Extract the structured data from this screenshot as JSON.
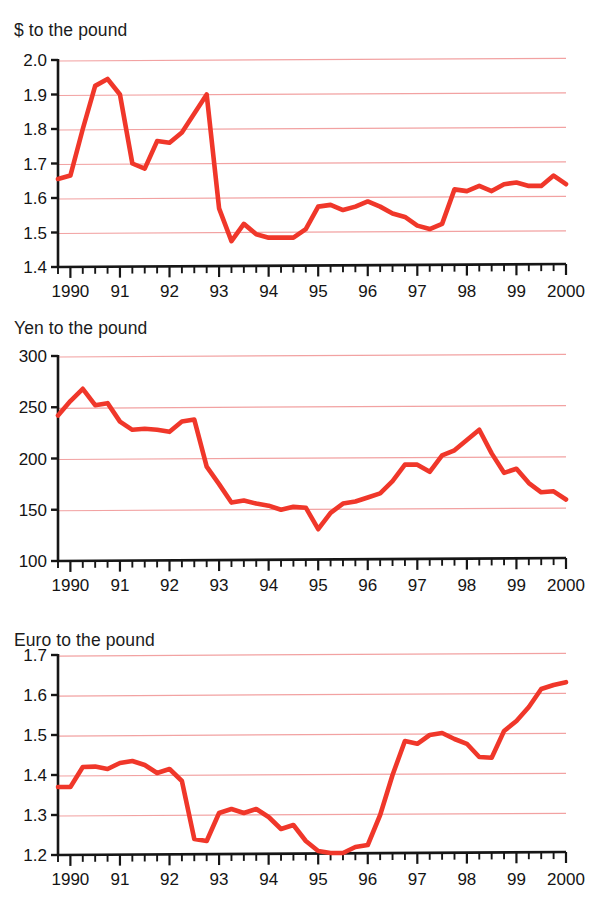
{
  "page": {
    "background": "#ffffff",
    "accent_red": "#f0372a",
    "grid_color": "#f2a2a2",
    "axis_color": "#161616"
  },
  "charts": [
    {
      "id": "dollar-to-pound",
      "title": "$ to the pound",
      "chart_data": {
        "type": "line",
        "title": "$ to the pound",
        "xlabel": "",
        "ylabel": "",
        "ylim": [
          1.4,
          2.0
        ],
        "yticks": [
          1.4,
          1.5,
          1.6,
          1.7,
          1.8,
          1.9,
          2.0
        ],
        "ytick_labels": [
          "1.4",
          "1.5",
          "1.6",
          "1.7",
          "1.8",
          "1.9",
          "2.0"
        ],
        "xlim": [
          1989.75,
          2000.0
        ],
        "xticks": [
          1990,
          1991,
          1992,
          1993,
          1994,
          1995,
          1996,
          1997,
          1998,
          1999,
          2000
        ],
        "xtick_labels": [
          "1990",
          "91",
          "92",
          "93",
          "94",
          "95",
          "96",
          "97",
          "98",
          "99",
          "2000"
        ],
        "grid": true,
        "legend": "none",
        "x": [
          1989.75,
          1990.0,
          1990.25,
          1990.5,
          1990.75,
          1991.0,
          1991.25,
          1991.5,
          1991.75,
          1992.0,
          1992.25,
          1992.5,
          1992.75,
          1993.0,
          1993.25,
          1993.5,
          1993.75,
          1994.0,
          1994.25,
          1994.5,
          1994.75,
          1995.0,
          1995.25,
          1995.5,
          1995.75,
          1996.0,
          1996.25,
          1996.5,
          1996.75,
          1997.0,
          1997.25,
          1997.5,
          1997.75,
          1998.0,
          1998.25,
          1998.5,
          1998.75,
          1999.0,
          1999.25,
          1999.5,
          1999.75,
          2000.0
        ],
        "values": [
          1.655,
          1.665,
          1.8,
          1.925,
          1.945,
          1.9,
          1.7,
          1.685,
          1.765,
          1.76,
          1.79,
          1.845,
          1.9,
          1.57,
          1.475,
          1.525,
          1.495,
          1.485,
          1.485,
          1.485,
          1.51,
          1.575,
          1.58,
          1.565,
          1.575,
          1.59,
          1.575,
          1.555,
          1.545,
          1.52,
          1.51,
          1.525,
          1.625,
          1.62,
          1.635,
          1.62,
          1.64,
          1.645,
          1.635,
          1.635,
          1.665,
          1.64
        ]
      }
    },
    {
      "id": "yen-to-pound",
      "title": "Yen to the pound",
      "chart_data": {
        "type": "line",
        "title": "Yen to the pound",
        "xlabel": "",
        "ylabel": "",
        "ylim": [
          100,
          300
        ],
        "yticks": [
          100,
          150,
          200,
          250,
          300
        ],
        "ytick_labels": [
          "100",
          "150",
          "200",
          "250",
          "300"
        ],
        "xlim": [
          1989.75,
          2000.0
        ],
        "xticks": [
          1990,
          1991,
          1992,
          1993,
          1994,
          1995,
          1996,
          1997,
          1998,
          1999,
          2000
        ],
        "xtick_labels": [
          "1990",
          "91",
          "92",
          "93",
          "94",
          "95",
          "96",
          "97",
          "98",
          "99",
          "2000"
        ],
        "grid": true,
        "legend": "none",
        "x": [
          1989.75,
          1990.0,
          1990.25,
          1990.5,
          1990.75,
          1991.0,
          1991.25,
          1991.5,
          1991.75,
          1992.0,
          1992.25,
          1992.5,
          1992.75,
          1993.0,
          1993.25,
          1993.5,
          1993.75,
          1994.0,
          1994.25,
          1994.5,
          1994.75,
          1995.0,
          1995.25,
          1995.5,
          1995.75,
          1996.0,
          1996.25,
          1996.5,
          1996.75,
          1997.0,
          1997.25,
          1997.5,
          1997.75,
          1998.0,
          1998.25,
          1998.5,
          1998.75,
          1999.0,
          1999.25,
          1999.5,
          1999.75,
          2000.0
        ],
        "values": [
          242,
          256,
          268,
          252,
          254,
          236,
          228,
          229,
          228,
          226,
          236,
          238,
          192,
          175,
          157,
          159,
          156,
          154,
          150,
          153,
          152,
          131,
          147,
          156,
          158,
          162,
          166,
          178,
          194,
          194,
          187,
          203,
          208,
          218,
          228,
          205,
          186,
          190,
          176,
          167,
          168,
          160
        ]
      }
    },
    {
      "id": "euro-to-pound",
      "title": "Euro to the pound",
      "chart_data": {
        "type": "line",
        "title": "Euro to the pound",
        "xlabel": "",
        "ylabel": "",
        "ylim": [
          1.2,
          1.7
        ],
        "yticks": [
          1.2,
          1.3,
          1.4,
          1.5,
          1.6,
          1.7
        ],
        "ytick_labels": [
          "1.2",
          "1.3",
          "1.4",
          "1.5",
          "1.6",
          "1.7"
        ],
        "xlim": [
          1989.75,
          2000.0
        ],
        "xticks": [
          1990,
          1991,
          1992,
          1993,
          1994,
          1995,
          1996,
          1997,
          1998,
          1999,
          2000
        ],
        "xtick_labels": [
          "1990",
          "91",
          "92",
          "93",
          "94",
          "95",
          "96",
          "97",
          "98",
          "99",
          "2000"
        ],
        "grid": true,
        "legend": "none",
        "x": [
          1989.75,
          1990.0,
          1990.25,
          1990.5,
          1990.75,
          1991.0,
          1991.25,
          1991.5,
          1991.75,
          1992.0,
          1992.25,
          1992.5,
          1992.75,
          1993.0,
          1993.25,
          1993.5,
          1993.75,
          1994.0,
          1994.25,
          1994.5,
          1994.75,
          1995.0,
          1995.25,
          1995.5,
          1995.75,
          1996.0,
          1996.25,
          1996.5,
          1996.75,
          1997.0,
          1997.25,
          1997.5,
          1997.75,
          1998.0,
          1998.25,
          1998.5,
          1998.75,
          1999.0,
          1999.25,
          1999.5,
          1999.75,
          2000.0
        ],
        "values": [
          1.37,
          1.37,
          1.42,
          1.421,
          1.415,
          1.43,
          1.435,
          1.425,
          1.405,
          1.415,
          1.385,
          1.24,
          1.235,
          1.305,
          1.315,
          1.305,
          1.315,
          1.295,
          1.265,
          1.275,
          1.235,
          1.21,
          1.205,
          1.205,
          1.22,
          1.225,
          1.3,
          1.4,
          1.485,
          1.478,
          1.5,
          1.505,
          1.49,
          1.478,
          1.445,
          1.443,
          1.51,
          1.535,
          1.57,
          1.615,
          1.625,
          1.632
        ]
      }
    }
  ]
}
